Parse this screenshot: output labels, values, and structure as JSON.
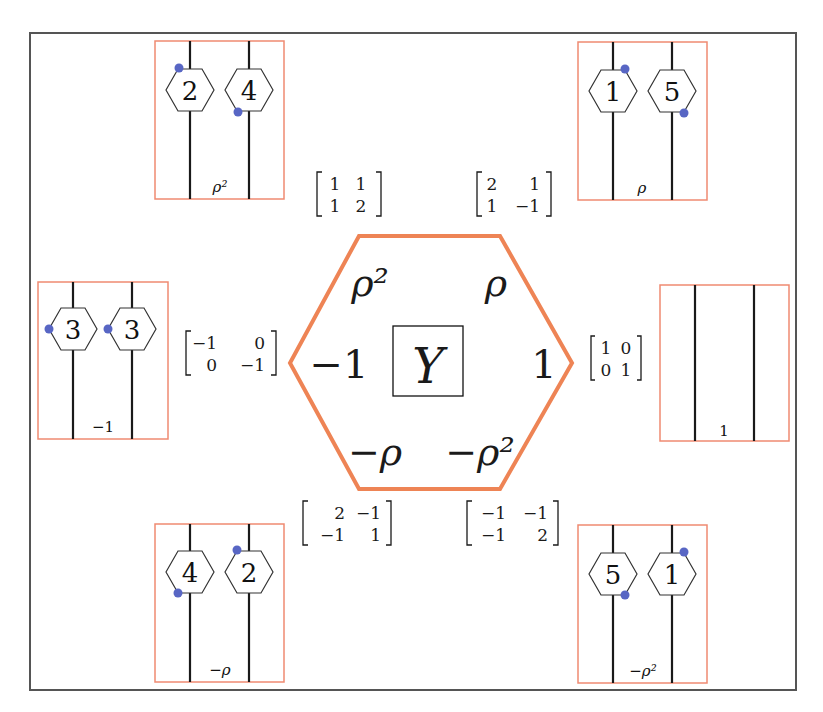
{
  "colors": {
    "frame": "#555555",
    "box_border": "#ef8a72",
    "hexagon_border": "#ee8455",
    "strand": "#1a1a1a",
    "dot": "#5866c4"
  },
  "center": {
    "symbol": "Y",
    "hexagon_labels": {
      "top_left": "ρ²",
      "top_right": "ρ",
      "left": "−1",
      "right": "1",
      "bottom_left": "−ρ",
      "bottom_right": "−ρ²"
    }
  },
  "matrices": [
    {
      "id": "top-left",
      "rows": [
        [
          "1",
          "1"
        ],
        [
          "1",
          "2"
        ]
      ]
    },
    {
      "id": "top-right",
      "rows": [
        [
          "2",
          "1"
        ],
        [
          "1",
          "−1"
        ]
      ]
    },
    {
      "id": "left",
      "rows": [
        [
          "−1",
          "0"
        ],
        [
          "0",
          "−1"
        ]
      ]
    },
    {
      "id": "right",
      "rows": [
        [
          "1",
          "0"
        ],
        [
          "0",
          "1"
        ]
      ]
    },
    {
      "id": "bottom-left",
      "rows": [
        [
          "2",
          "−1"
        ],
        [
          "−1",
          "1"
        ]
      ]
    },
    {
      "id": "bottom-right",
      "rows": [
        [
          "−1",
          "−1"
        ],
        [
          "−1",
          "2"
        ]
      ]
    }
  ],
  "boxes": [
    {
      "id": "top-left",
      "label": "ρ²",
      "nodes": [
        "2",
        "4"
      ],
      "dots": [
        "upper-left",
        "lower-left"
      ]
    },
    {
      "id": "top-right",
      "label": "ρ",
      "nodes": [
        "1",
        "5"
      ],
      "dots": [
        "upper-right",
        "lower-right"
      ]
    },
    {
      "id": "left",
      "label": "−1",
      "nodes": [
        "3",
        "3"
      ],
      "dots": [
        "left",
        "left"
      ]
    },
    {
      "id": "right",
      "label": "1",
      "nodes": [],
      "dots": []
    },
    {
      "id": "bottom-left",
      "label": "−ρ",
      "nodes": [
        "4",
        "2"
      ],
      "dots": [
        "lower-left",
        "upper-left"
      ]
    },
    {
      "id": "bottom-right",
      "label": "−ρ²",
      "nodes": [
        "5",
        "1"
      ],
      "dots": [
        "lower-right",
        "upper-right"
      ]
    }
  ]
}
